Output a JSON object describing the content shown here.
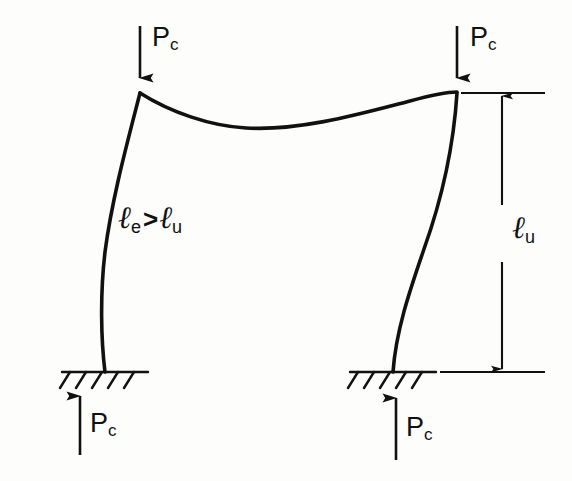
{
  "figure": {
    "type": "structural-engineering-diagram",
    "background_color": "#fdfdfc",
    "ink_color": "#111111"
  },
  "loads": {
    "symbol": "P",
    "subscript": "c",
    "top_left": {
      "label_main": "P",
      "label_sub": "c",
      "direction": "down"
    },
    "top_right": {
      "label_main": "P",
      "label_sub": "c",
      "direction": "down"
    },
    "bottom_left": {
      "label_main": "P",
      "label_sub": "c",
      "direction": "up"
    },
    "bottom_right": {
      "label_main": "P",
      "label_sub": "c",
      "direction": "up"
    }
  },
  "annotations": {
    "effective_length": {
      "ell_left": "ℓ",
      "sub_left": "e",
      "relation": ">",
      "ell_right": "ℓ",
      "sub_right": "u",
      "full_text": "ℓe > ℓu"
    },
    "unbraced_length": {
      "ell": "ℓ",
      "sub": "u",
      "full_text": "ℓu"
    }
  },
  "geometry": {
    "left_column": {
      "top": [
        140,
        93
      ],
      "base": [
        105,
        372
      ],
      "bow_direction": "left"
    },
    "right_column": {
      "top": [
        457,
        93
      ],
      "base": [
        393,
        372
      ],
      "bow_direction": "left"
    },
    "beam": {
      "left_end": [
        140,
        93
      ],
      "right_end": [
        457,
        93
      ],
      "shape": "sagging-then-rising"
    },
    "supports": [
      {
        "name": "left-fixed-support",
        "x": 105,
        "y": 372
      },
      {
        "name": "right-fixed-support",
        "x": 393,
        "y": 372
      }
    ],
    "dimension_line": {
      "x": 502,
      "top_y": 93,
      "bottom_y": 372,
      "arrowheads": "both"
    }
  }
}
